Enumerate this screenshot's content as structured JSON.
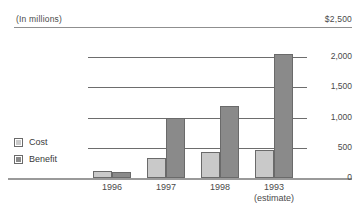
{
  "header": {
    "units_label": "(In millions)",
    "top_value": "$2,500"
  },
  "legend": {
    "items": [
      {
        "label": "Cost",
        "color": "#c9c9c9",
        "swatch_icon": "square-swatch-icon"
      },
      {
        "label": "Benefit",
        "color": "#8a8a8a",
        "swatch_icon": "square-swatch-icon"
      }
    ]
  },
  "axis": {
    "tick_labels": [
      "$2,500",
      "2,000",
      "1,500",
      "1,000",
      "500",
      "0"
    ]
  },
  "categories": [
    {
      "label": "1996",
      "sub": ""
    },
    {
      "label": "1997",
      "sub": ""
    },
    {
      "label": "1998",
      "sub": ""
    },
    {
      "label": "1993",
      "sub": "(estimate)"
    }
  ],
  "chart_data": {
    "type": "bar",
    "title": "",
    "subtitle": "",
    "xlabel": "",
    "ylabel": "(In millions)",
    "categories": [
      "1996",
      "1997",
      "1998",
      "1993"
    ],
    "category_notes": [
      "",
      "",
      "",
      "(estimate)"
    ],
    "series": [
      {
        "name": "Cost",
        "color": "#c9c9c9",
        "values": [
          120,
          330,
          430,
          470
        ]
      },
      {
        "name": "Benefit",
        "color": "#8a8a8a",
        "values": [
          100,
          1000,
          1200,
          2050
        ]
      }
    ],
    "ylim": [
      0,
      2500
    ],
    "yticks": [
      0,
      500,
      1000,
      1500,
      2000,
      2500
    ],
    "ytick_labels": [
      "0",
      "500",
      "1,000",
      "1,500",
      "2,000",
      "$2,500"
    ],
    "grid": true,
    "grid_axis": "y",
    "legend_position": "left"
  }
}
